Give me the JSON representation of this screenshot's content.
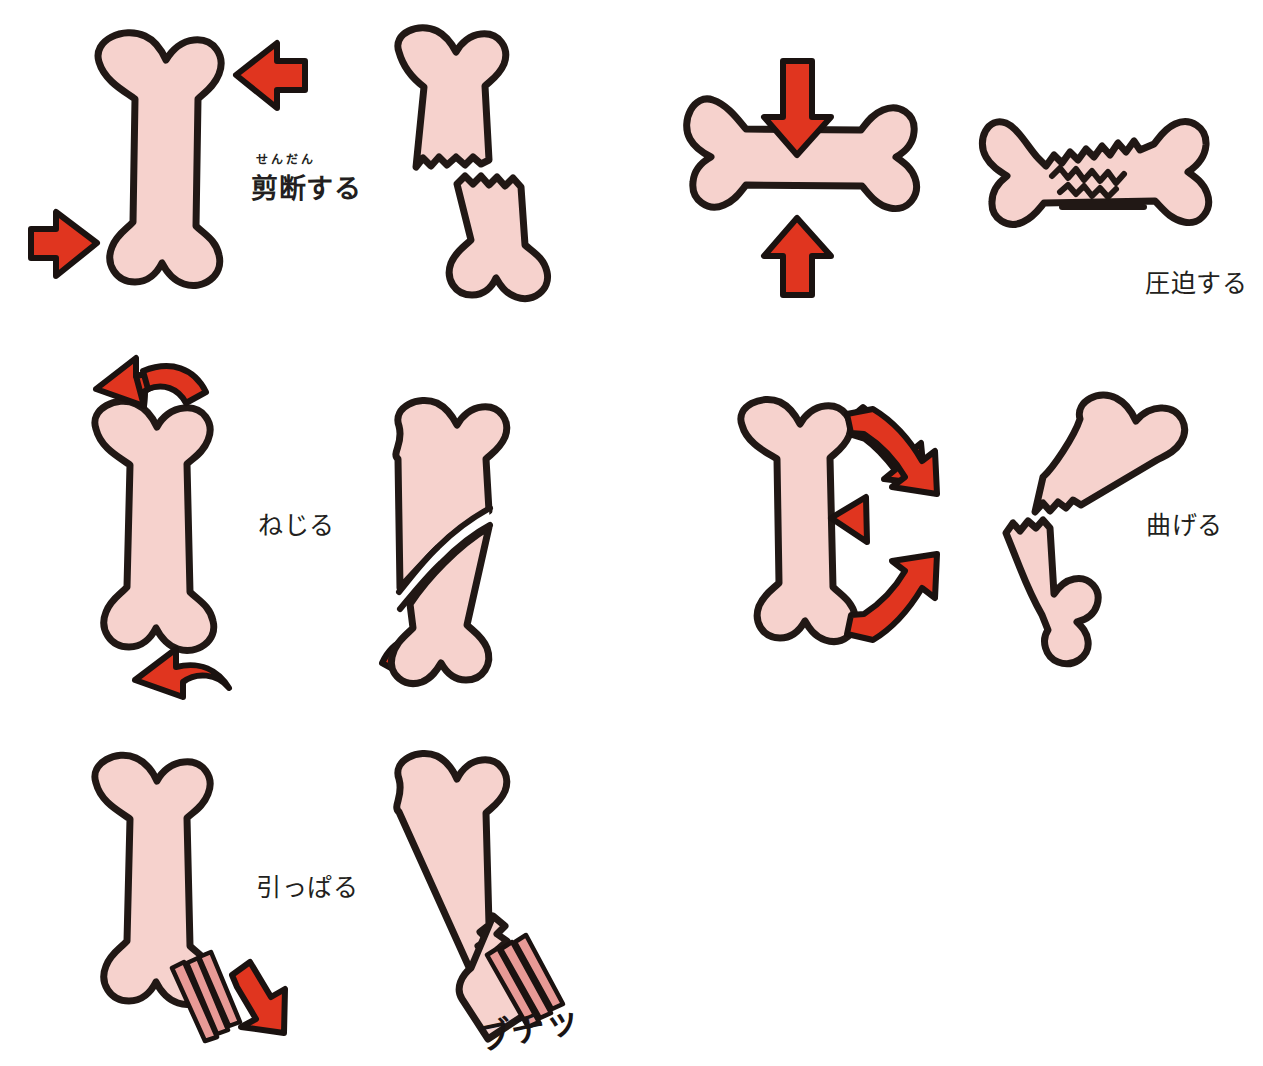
{
  "figure": {
    "background_color": "#ffffff",
    "palette": {
      "bone_fill": "#f6d2cd",
      "bone_outline": "#211815",
      "arrow_fill": "#e0351f",
      "arrow_outline": "#1a1210",
      "tendon_fill": "#e89a96",
      "tendon_outline": "#1a1210",
      "text_color": "#231f20"
    }
  },
  "rows": [
    {
      "id": "shear",
      "label": "剪断する",
      "furigana": "せんだん",
      "label_kind": "main",
      "intact_bone": "vertical-long-bone",
      "fractured_bone": "transverse-offset-fracture",
      "arrows": [
        "arrow-left-upper-right",
        "arrow-right-lower-left"
      ]
    },
    {
      "id": "compress",
      "label": "圧迫する",
      "furigana": "",
      "label_kind": "plain",
      "intact_bone": "horizontal-long-bone",
      "fractured_bone": "compressed-crushed-bone",
      "arrows": [
        "arrow-down-top",
        "arrow-up-bottom"
      ]
    },
    {
      "id": "twist",
      "label": "ねじる",
      "furigana": "",
      "label_kind": "plain",
      "intact_bone": "vertical-long-bone",
      "fractured_bone": "spiral-fracture",
      "arrows": [
        "curved-arrow-top-left",
        "curved-arrow-bottom-right"
      ]
    },
    {
      "id": "bend",
      "label": "曲げる",
      "furigana": "",
      "label_kind": "plain",
      "intact_bone": "vertical-long-bone",
      "fractured_bone": "angulated-fracture",
      "arrows": [
        "bent-arrow-upper-right",
        "triangle-pointer-left",
        "bent-arrow-lower-right"
      ]
    },
    {
      "id": "pull",
      "label": "引っぱる",
      "furigana": "",
      "label_kind": "plain",
      "intact_bone": "vertical-long-bone-with-tendon",
      "fractured_bone": "avulsion-fracture",
      "arrows": [
        "arrow-down-right"
      ],
      "onomatopoeia": "ブチッ"
    }
  ]
}
